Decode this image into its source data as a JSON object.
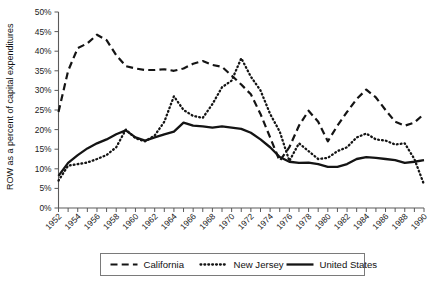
{
  "chart_data": {
    "type": "line",
    "title": "",
    "xlabel": "",
    "ylabel": "ROW as a percent of capital expenditures",
    "xlim": [
      1952,
      1990
    ],
    "ylim": [
      0,
      50
    ],
    "ytick_labels": [
      "0%",
      "5%",
      "10%",
      "15%",
      "20%",
      "25%",
      "30%",
      "35%",
      "40%",
      "45%",
      "50%"
    ],
    "ytick_values": [
      0,
      5,
      10,
      15,
      20,
      25,
      30,
      35,
      40,
      45,
      50
    ],
    "xtick_labels": [
      "1952",
      "1954",
      "1956",
      "1958",
      "1960",
      "1962",
      "1964",
      "1966",
      "1968",
      "1970",
      "1972",
      "1974",
      "1976",
      "1978",
      "1980",
      "1982",
      "1984",
      "1986",
      "1988",
      "1990"
    ],
    "xtick_values": [
      1952,
      1954,
      1956,
      1958,
      1960,
      1962,
      1964,
      1966,
      1968,
      1970,
      1972,
      1974,
      1976,
      1978,
      1980,
      1982,
      1984,
      1986,
      1988,
      1990
    ],
    "x": [
      1952,
      1953,
      1954,
      1955,
      1956,
      1957,
      1958,
      1959,
      1960,
      1961,
      1962,
      1963,
      1964,
      1965,
      1966,
      1967,
      1968,
      1969,
      1970,
      1971,
      1972,
      1973,
      1974,
      1975,
      1976,
      1977,
      1978,
      1979,
      1980,
      1981,
      1982,
      1983,
      1984,
      1985,
      1986,
      1987,
      1988,
      1989,
      1990
    ],
    "grid": false,
    "legend_position": "bottom",
    "series": [
      {
        "name": "California",
        "style": "dashed",
        "color": "#141414",
        "values": [
          24.5,
          35.0,
          40.8,
          42.0,
          44.2,
          42.8,
          39.0,
          36.2,
          35.6,
          35.2,
          35.2,
          35.4,
          35.0,
          35.6,
          36.8,
          37.5,
          36.5,
          36.0,
          33.8,
          31.5,
          29.0,
          24.0,
          18.0,
          12.0,
          15.5,
          21.0,
          24.8,
          22.0,
          17.0,
          21.0,
          24.5,
          27.8,
          30.2,
          28.2,
          25.0,
          22.0,
          21.0,
          21.8,
          24.0
        ]
      },
      {
        "name": "New Jersey",
        "style": "dotted",
        "color": "#141414",
        "values": [
          7.0,
          10.8,
          11.2,
          11.6,
          12.5,
          13.5,
          15.5,
          20.0,
          17.8,
          17.0,
          18.5,
          22.0,
          28.5,
          25.0,
          23.5,
          23.0,
          26.5,
          30.8,
          32.5,
          38.2,
          33.5,
          30.0,
          24.0,
          19.5,
          12.0,
          16.5,
          14.5,
          12.5,
          12.8,
          14.5,
          15.5,
          18.0,
          19.0,
          17.5,
          17.2,
          16.2,
          16.5,
          12.5,
          6.0
        ]
      },
      {
        "name": "United States",
        "style": "solid",
        "color": "#141414",
        "values": [
          8.2,
          11.5,
          13.5,
          15.2,
          16.5,
          17.5,
          18.8,
          19.8,
          18.0,
          17.2,
          18.0,
          18.8,
          19.5,
          21.8,
          21.0,
          20.8,
          20.5,
          20.8,
          20.5,
          20.2,
          19.2,
          17.5,
          15.5,
          13.0,
          11.8,
          11.5,
          11.6,
          11.2,
          10.5,
          10.5,
          11.2,
          12.5,
          13.0,
          12.8,
          12.5,
          12.2,
          11.5,
          11.8,
          12.2
        ]
      }
    ]
  },
  "legend": {
    "items": [
      {
        "label": "California",
        "style": "dashed"
      },
      {
        "label": "New Jersey",
        "style": "dotted"
      },
      {
        "label": "United States",
        "style": "solid"
      }
    ]
  }
}
